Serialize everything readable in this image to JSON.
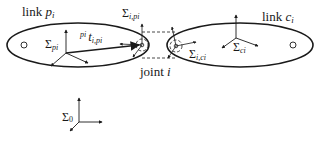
{
  "diagram": {
    "title": "",
    "colors": {
      "stroke": "#1a1a1a",
      "background": "#ffffff"
    },
    "links": [
      {
        "id": "parent",
        "label_prefix": "link ",
        "label_var": "p",
        "label_sub": "i",
        "frame_label_sigma": "Σ",
        "frame_label_sub": "pi"
      },
      {
        "id": "child",
        "label_prefix": "link ",
        "label_var": "c",
        "label_sub": "i",
        "frame_label_sigma": "Σ",
        "frame_label_sub": "ci"
      }
    ],
    "joint": {
      "label_prefix": "joint ",
      "label_var": "i"
    },
    "joint_frames": {
      "parent_side": {
        "sigma": "Σ",
        "sub": "i,pi"
      },
      "child_side": {
        "sigma": "Σ",
        "sub": "i,ci"
      }
    },
    "vector": {
      "sup": "pi",
      "main": "t",
      "sub": "i,pi"
    },
    "world_frame": {
      "sigma": "Σ",
      "sub": "0"
    }
  }
}
